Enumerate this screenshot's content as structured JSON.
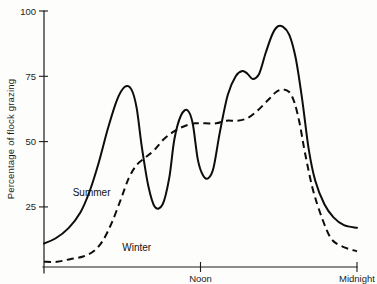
{
  "chart_data": {
    "type": "line",
    "title": "",
    "subtitle": "",
    "xlabel": "",
    "ylabel": "Percentage of flock grazing",
    "ylim": [
      0,
      100
    ],
    "xlim": [
      0,
      24
    ],
    "grid": false,
    "legend_position": "inline-annotations",
    "y_ticks": [
      "25",
      "50",
      "75",
      "100"
    ],
    "y_tick_values": [
      25,
      50,
      75,
      100
    ],
    "x_ticks": [
      "Noon",
      "Midnight"
    ],
    "x_tick_values": [
      12,
      24
    ],
    "annotations": [
      {
        "text": "Summer",
        "x": 2.2,
        "y": 29
      },
      {
        "text": "Winter",
        "x": 6.0,
        "y": 8
      }
    ],
    "series": [
      {
        "name": "Summer",
        "style": "solid",
        "x": [
          0,
          0.9,
          1.9,
          2.8,
          3.5,
          4.2,
          4.9,
          5.6,
          6.2,
          6.7,
          7.1,
          7.5,
          8.0,
          8.5,
          9.1,
          9.6,
          10.0,
          10.5,
          11.0,
          11.4,
          11.8,
          12.2,
          12.6,
          13.0,
          13.5,
          14.1,
          14.7,
          15.2,
          15.6,
          16.0,
          16.5,
          17.0,
          17.5,
          17.9,
          18.3,
          18.8,
          19.3,
          19.8,
          20.3,
          20.8,
          21.5,
          22.2,
          23.0,
          24.0
        ],
        "y": [
          11,
          13,
          17,
          23,
          31,
          42,
          55,
          66,
          71,
          70,
          63,
          48,
          33,
          25,
          26,
          36,
          51,
          60,
          62,
          57,
          43,
          37,
          36,
          40,
          54,
          68,
          75,
          77,
          76,
          74,
          76,
          84,
          91,
          94,
          94,
          91,
          82,
          66,
          47,
          35,
          26,
          21,
          18,
          17
        ]
      },
      {
        "name": "Winter",
        "style": "dashed",
        "x": [
          0,
          1.0,
          2.0,
          3.0,
          3.8,
          4.5,
          5.2,
          5.9,
          6.5,
          7.1,
          7.8,
          8.5,
          9.2,
          10.0,
          10.8,
          11.6,
          12.4,
          13.2,
          14.0,
          14.8,
          15.6,
          16.4,
          17.2,
          17.8,
          18.3,
          18.8,
          19.2,
          19.6,
          20.0,
          20.6,
          21.3,
          22.0,
          22.8,
          24.0
        ],
        "y": [
          4,
          4,
          5,
          6,
          8,
          12,
          19,
          28,
          36,
          41,
          44,
          47,
          51,
          54,
          56,
          57,
          57,
          57,
          58,
          58,
          59,
          62,
          66,
          69,
          70,
          69,
          65,
          57,
          46,
          32,
          21,
          13,
          10,
          8
        ]
      }
    ]
  },
  "geometry": {
    "plot_left": 44,
    "plot_right": 357,
    "plot_bottom": 267,
    "plot_top": 11,
    "y_value_top": 100,
    "y_value_bottom": 2.0
  }
}
